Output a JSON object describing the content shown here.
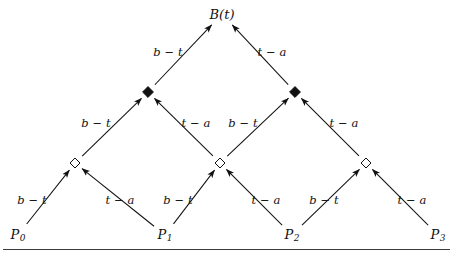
{
  "figure": {
    "title_label": "B(t)",
    "left_edge_label": "b − t",
    "right_edge_label": "t − a",
    "background_color": "#ffffff",
    "ink_color": "#111111",
    "rule_color": "#3b3b3b"
  },
  "chart_data": {
    "type": "diagram",
    "title": "B(t)",
    "subtitle": "",
    "xlabel": "",
    "ylabel": "",
    "levels": [
      {
        "level": 0,
        "marker": "text",
        "nodes": [
          {
            "id": "P0",
            "label": "P",
            "subscript": "0",
            "x": 18,
            "y": 235
          },
          {
            "id": "P1",
            "label": "P",
            "subscript": "1",
            "x": 165,
            "y": 235
          },
          {
            "id": "P2",
            "label": "P",
            "subscript": "2",
            "x": 292,
            "y": 235
          },
          {
            "id": "P3",
            "label": "P",
            "subscript": "3",
            "x": 438,
            "y": 235
          }
        ]
      },
      {
        "level": 1,
        "marker": "hollow-diamond",
        "nodes": [
          {
            "id": "L1N0",
            "label": "",
            "x": 75,
            "y": 163
          },
          {
            "id": "L1N1",
            "label": "",
            "x": 220,
            "y": 163
          },
          {
            "id": "L1N2",
            "label": "",
            "x": 366,
            "y": 163
          }
        ]
      },
      {
        "level": 2,
        "marker": "filled-diamond",
        "nodes": [
          {
            "id": "L2N0",
            "label": "",
            "x": 148,
            "y": 92
          },
          {
            "id": "L2N1",
            "label": "",
            "x": 295,
            "y": 92
          }
        ]
      },
      {
        "level": 3,
        "marker": "text",
        "nodes": [
          {
            "id": "Bt",
            "label": "B(t)",
            "subscript": "",
            "x": 222,
            "y": 14
          }
        ]
      }
    ],
    "edges": [
      {
        "from": "P0",
        "to": "L1N0",
        "label": "b − t",
        "label_x": 32,
        "label_y": 201
      },
      {
        "from": "P1",
        "to": "L1N0",
        "label": "t − a",
        "label_x": 120,
        "label_y": 201
      },
      {
        "from": "P1",
        "to": "L1N1",
        "label": "b − t",
        "label_x": 178,
        "label_y": 201
      },
      {
        "from": "P2",
        "to": "L1N1",
        "label": "t − a",
        "label_x": 266,
        "label_y": 201
      },
      {
        "from": "P2",
        "to": "L1N2",
        "label": "b − t",
        "label_x": 324,
        "label_y": 201
      },
      {
        "from": "P3",
        "to": "L1N2",
        "label": "t − a",
        "label_x": 412,
        "label_y": 201
      },
      {
        "from": "L1N0",
        "to": "L2N0",
        "label": "b − t",
        "label_x": 96,
        "label_y": 124
      },
      {
        "from": "L1N1",
        "to": "L2N0",
        "label": "t − a",
        "label_x": 196,
        "label_y": 124
      },
      {
        "from": "L1N1",
        "to": "L2N1",
        "label": "b − t",
        "label_x": 243,
        "label_y": 124
      },
      {
        "from": "L1N2",
        "to": "L2N1",
        "label": "t − a",
        "label_x": 344,
        "label_y": 124
      },
      {
        "from": "L2N0",
        "to": "Bt",
        "label": "b − t",
        "label_x": 168,
        "label_y": 53
      },
      {
        "from": "L2N1",
        "to": "Bt",
        "label": "t − a",
        "label_x": 272,
        "label_y": 53
      }
    ],
    "baseline_rule": {
      "x1": 3,
      "x2": 450,
      "y": 249
    },
    "grid": false,
    "legend": null
  }
}
